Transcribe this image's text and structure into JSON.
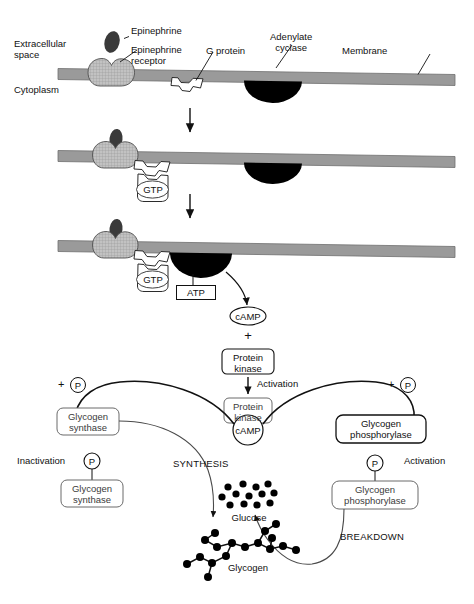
{
  "diagram": {
    "colors": {
      "membrane": "#9a9a9a",
      "membrane_stroke": "#6f6f6f",
      "receptor_fill": "#b9b9b9",
      "epinephrine_fill": "#3a3a3a",
      "cyclase_fill": "#000000",
      "gprotein_fill": "#ffffff",
      "line": "#111111",
      "text": "#111111"
    }
  },
  "panel1": {
    "labels": {
      "extracellular": "Extracellular\nspace",
      "cytoplasm": "Cytoplasm",
      "epinephrine": "Epinephrine",
      "epinephrine_receptor": "Epinephrine\nreceptor",
      "g_protein": "G protein",
      "adenylate_cyclase": "Adenylate\ncyclase",
      "membrane": "Membrane"
    }
  },
  "panel2": {
    "labels": {
      "gtp": "GTP"
    }
  },
  "panel3": {
    "labels": {
      "gtp": "GTP",
      "atp": "ATP",
      "camp": "cAMP"
    }
  },
  "cascade": {
    "plus": "+",
    "protein_kinase": "Protein\nkinase",
    "activation": "Activation",
    "protein_kinase_active": "Protein\nkinase",
    "camp_bound": "cAMP"
  },
  "left_branch": {
    "plus_p": "+",
    "p": "P",
    "glycogen_synthase_active": "Glycogen\nsynthase",
    "inactivation": "Inactivation",
    "p_tag": "P",
    "glycogen_synthase_inactive": "Glycogen\nsynthase",
    "synthesis": "SYNTHESIS"
  },
  "right_branch": {
    "plus_p": "+",
    "p": "P",
    "glycogen_phosphorylase_inactive": "Glycogen\nphosphorylase",
    "activation": "Activation",
    "p_tag": "P",
    "glycogen_phosphorylase_active": "Glycogen\nphosphorylase",
    "breakdown": "BREAKDOWN"
  },
  "molecules": {
    "glucose": "Glucose",
    "glycogen": "Glycogen"
  }
}
